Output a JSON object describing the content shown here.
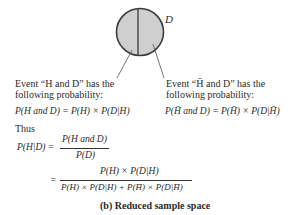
{
  "diagram": {
    "set_label": "D",
    "fill_color": "#cfcfcf",
    "stroke_color": "#3a3a3a"
  },
  "left_event": {
    "line1": "Event “H and D” has the",
    "line2": "following probability:",
    "formula": "P(H and D) = P(H) × P(D|H)"
  },
  "right_event": {
    "line1": "Event “H̄ and D” has the",
    "line2": "following probability:",
    "formula": "P(H̄ and D) = P(H̄) × P(D|H̄)"
  },
  "thus_label": "Thus",
  "bayes": {
    "lhs": "P(H|D) =",
    "frac1_num": "P(H and D)",
    "frac1_den": "P(D)",
    "eq2": "=",
    "frac2_num": "P(H) × P(D|H)",
    "frac2_den": "P(H) × P(D|H) + P(H̄) × P(D|H̄)"
  },
  "caption": "(b)  Reduced sample space"
}
